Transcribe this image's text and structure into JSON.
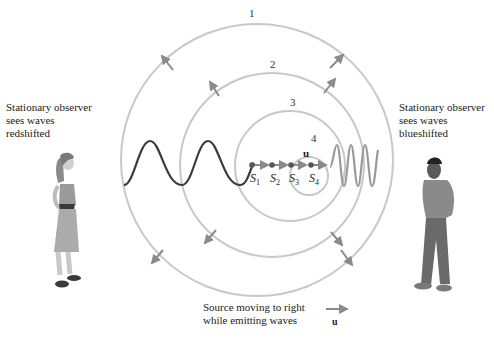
{
  "left_observer": {
    "lines": [
      "Stationary observer",
      "sees waves",
      "redshifted"
    ]
  },
  "right_observer": {
    "lines": [
      "Stationary observer",
      "sees waves",
      "blueshifted"
    ]
  },
  "wavefronts": [
    {
      "label": "1"
    },
    {
      "label": "2"
    },
    {
      "label": "3"
    },
    {
      "label": "4"
    }
  ],
  "source_positions": [
    {
      "label": "S",
      "sub": "1"
    },
    {
      "label": "S",
      "sub": "2"
    },
    {
      "label": "S",
      "sub": "3"
    },
    {
      "label": "S",
      "sub": "4"
    }
  ],
  "velocity_label": "u",
  "caption": {
    "lines": [
      "Source moving to right",
      "while emitting waves"
    ],
    "arrow_label": "u"
  },
  "colors": {
    "wavefront": "#c8c8c8",
    "arrow": "#8a8a8a",
    "redshift_wave": "#3a3a3a",
    "blueshift_wave": "#9a9a9a",
    "source_dot": "#555555"
  }
}
